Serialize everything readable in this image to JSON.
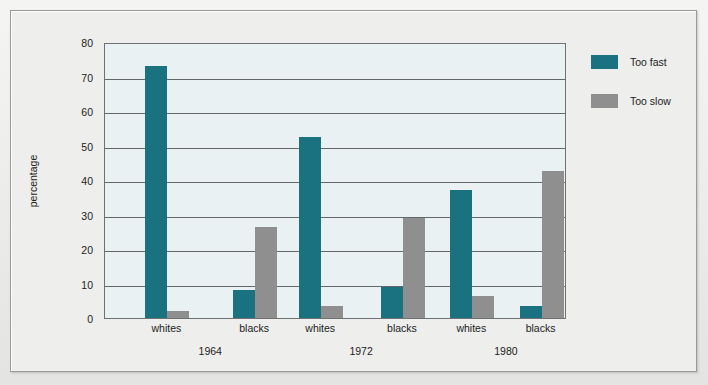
{
  "chart_data": {
    "type": "bar",
    "title": "",
    "subtitle": "",
    "xlabel": "",
    "ylabel": "percentage",
    "ylim": [
      0,
      80
    ],
    "yticks": [
      0,
      10,
      20,
      30,
      40,
      50,
      60,
      70,
      80
    ],
    "grid": true,
    "legend_position": "right",
    "groups": [
      "1964",
      "1972",
      "1980"
    ],
    "subgroups": [
      "whites",
      "blacks"
    ],
    "categories": [
      "1964 whites",
      "1964 blacks",
      "1972 whites",
      "1972 blacks",
      "1980 whites",
      "1980 blacks"
    ],
    "series": [
      {
        "name": "Too fast",
        "color": "#1a7280",
        "values": [
          73,
          8,
          52.5,
          9,
          37,
          3.5
        ]
      },
      {
        "name": "Too slow",
        "color": "#8e8f8e",
        "values": [
          2,
          26.5,
          3.5,
          29,
          6.5,
          42.5
        ]
      }
    ]
  },
  "legend": {
    "items": [
      {
        "label": "Too fast",
        "color": "#1a7280"
      },
      {
        "label": "Too slow",
        "color": "#8e8f8e"
      }
    ]
  },
  "axes": {
    "y_title": "percentage",
    "y_tick_labels": [
      "80",
      "70",
      "60",
      "50",
      "40",
      "30",
      "20",
      "10",
      "0"
    ],
    "x_sub_labels": [
      "whites",
      "blacks",
      "whites",
      "blacks",
      "whites",
      "blacks"
    ],
    "x_group_labels": [
      "1964",
      "1972",
      "1980"
    ]
  },
  "colors": {
    "too_fast": "#1a7280",
    "too_slow": "#8e8f8e",
    "plot_background": "#eaf1f2",
    "gridline": "#63686a",
    "frame_background": "#eeeeec",
    "page_background": "#e8e8e6"
  }
}
